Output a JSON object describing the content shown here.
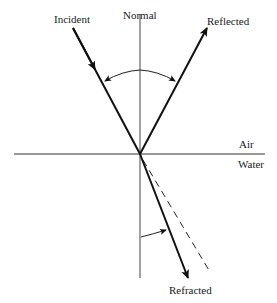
{
  "diagram": {
    "type": "refraction-reflection-ray-diagram",
    "labels": {
      "incident": "Incident",
      "normal": "Normal",
      "reflected": "Reflected",
      "air": "Air",
      "water": "Water",
      "refracted": "Refracted"
    },
    "elements": {
      "interface_line": {
        "from": [
          14,
          154
        ],
        "to": [
          265,
          154
        ]
      },
      "normal_line": {
        "from": [
          140,
          14
        ],
        "to": [
          140,
          278
        ]
      },
      "incident_ray": {
        "from": [
          73,
          28
        ],
        "to": [
          140,
          154
        ],
        "arrow": "midway-pointing-down"
      },
      "reflected_ray": {
        "from": [
          140,
          154
        ],
        "to": [
          207,
          28
        ],
        "arrow": "end"
      },
      "refracted_ray": {
        "from": [
          140,
          154
        ],
        "to": [
          188,
          278
        ],
        "arrow": "end"
      },
      "undeviated_extension": {
        "from": [
          140,
          154
        ],
        "to": [
          210,
          272
        ],
        "style": "dashed"
      },
      "angle_arc_incidence_reflection": {
        "between": [
          "incident_ray",
          "reflected_ray"
        ],
        "arrows": "both-ends"
      },
      "angle_arc_refraction": {
        "between": [
          "normal_line",
          "refracted_ray"
        ],
        "arrows": "end"
      }
    },
    "colors": {
      "line": "#111111",
      "normal": "#333333",
      "background": "#ffffff"
    }
  }
}
